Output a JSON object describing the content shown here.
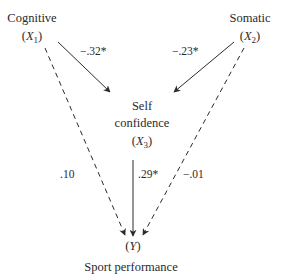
{
  "nodes": {
    "cognitive": {
      "name": "Cognitive",
      "var": "X",
      "sub": "1"
    },
    "somatic": {
      "name": "Somatic",
      "var": "X",
      "sub": "2"
    },
    "self_confidence": {
      "name_line1": "Self",
      "name_line2": "confidence",
      "var": "X",
      "sub": "3"
    },
    "performance": {
      "var": "Y",
      "name": "Sport performance"
    }
  },
  "paths": [
    {
      "from": "cognitive",
      "to": "self_confidence",
      "coef": "−.32*",
      "style": "solid"
    },
    {
      "from": "somatic",
      "to": "self_confidence",
      "coef": "−.23*",
      "style": "solid"
    },
    {
      "from": "self_confidence",
      "to": "performance",
      "coef": ".29*",
      "style": "solid"
    },
    {
      "from": "cognitive",
      "to": "performance",
      "coef": ".10",
      "style": "dashed"
    },
    {
      "from": "somatic",
      "to": "performance",
      "coef": "−.01",
      "style": "dashed"
    }
  ],
  "colors": {
    "ink": "#2a2a2a",
    "background": "#ffffff"
  }
}
